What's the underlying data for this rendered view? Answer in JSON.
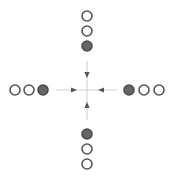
{
  "diagram": {
    "center": {
      "x": 87,
      "y": 90
    },
    "colors": {
      "background": "#ffffff",
      "open_stroke": "#555555",
      "open_fill": "#ffffff",
      "filled_fill": "#666666",
      "filled_stroke": "#4a4a4a",
      "axis_line": "#cfcfcf",
      "arrow": "#555555"
    },
    "circle_radius": 5,
    "groups": [
      {
        "name": "top",
        "circles": [
          {
            "x": 87,
            "y": 16,
            "filled": false
          },
          {
            "x": 87,
            "y": 31,
            "filled": false
          },
          {
            "x": 87,
            "y": 46,
            "filled": true
          }
        ],
        "arrow": {
          "x1": 87,
          "y1": 61,
          "x2": 87,
          "y2": 90,
          "tip_x": 87,
          "tip_y": 78,
          "direction": "down"
        }
      },
      {
        "name": "left",
        "circles": [
          {
            "x": 15,
            "y": 90,
            "filled": false
          },
          {
            "x": 29,
            "y": 90,
            "filled": false
          },
          {
            "x": 43,
            "y": 90,
            "filled": true
          }
        ],
        "arrow": {
          "x1": 56,
          "y1": 90,
          "x2": 87,
          "y2": 90,
          "tip_x": 77,
          "tip_y": 90,
          "direction": "right"
        }
      },
      {
        "name": "right",
        "circles": [
          {
            "x": 129,
            "y": 90,
            "filled": true
          },
          {
            "x": 144,
            "y": 90,
            "filled": false
          },
          {
            "x": 159,
            "y": 90,
            "filled": false
          }
        ],
        "arrow": {
          "x1": 117,
          "y1": 90,
          "x2": 87,
          "y2": 90,
          "tip_x": 98,
          "tip_y": 90,
          "direction": "left"
        }
      },
      {
        "name": "bottom",
        "circles": [
          {
            "x": 87,
            "y": 134,
            "filled": true
          },
          {
            "x": 87,
            "y": 149,
            "filled": false
          },
          {
            "x": 87,
            "y": 164,
            "filled": false
          }
        ],
        "arrow": {
          "x1": 87,
          "y1": 120,
          "x2": 87,
          "y2": 90,
          "tip_x": 87,
          "tip_y": 102,
          "direction": "up"
        }
      }
    ]
  }
}
